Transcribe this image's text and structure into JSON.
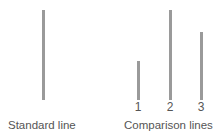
{
  "diagram": {
    "standard": {
      "label": "Standard line",
      "length": 90
    },
    "comparison": {
      "label": "Comparison lines",
      "lines": [
        {
          "number": "1",
          "length": 39
        },
        {
          "number": "2",
          "length": 90
        },
        {
          "number": "3",
          "length": 68
        }
      ]
    },
    "colors": {
      "line": "#9a9a9a",
      "text": "#555555"
    }
  }
}
